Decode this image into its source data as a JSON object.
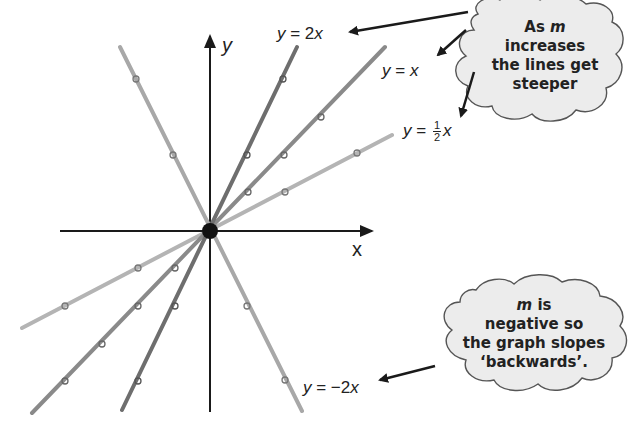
{
  "diagram": {
    "type": "graph-of-lines-through-origin",
    "axes": {
      "x_label": "x",
      "y_label": "y"
    },
    "origin_marker": "filled-dot",
    "lines": [
      {
        "id": "y2x",
        "equation": "y = 2x",
        "slope": 2,
        "color": "#6e6e6e"
      },
      {
        "id": "yx",
        "equation": "y = x",
        "slope": 1,
        "color": "#8a8a8a"
      },
      {
        "id": "yhalfx",
        "equation": "y = ½x",
        "slope": 0.5,
        "color": "#b4b4b4"
      },
      {
        "id": "yneg2x",
        "equation": "y = −2x",
        "slope": -2,
        "color": "#a8a8a8"
      }
    ],
    "labels": {
      "y2x": {
        "lhs": "y",
        "eq": " = 2",
        "var": "x"
      },
      "yx": {
        "lhs": "y",
        "eq": " = ",
        "var": "x"
      },
      "yhalfx": {
        "lhs": "y",
        "eq": " = ",
        "num": "1",
        "den": "2",
        "var": "x"
      },
      "yneg2x": {
        "lhs": "y",
        "eq": " = −2",
        "var": "x"
      }
    },
    "clouds": {
      "top": {
        "line1_prefix": "As ",
        "line1_var": "m",
        "line2": "increases",
        "line3": "the lines get",
        "line4": "steeper"
      },
      "bottom": {
        "line1_var": "m",
        "line1_suffix": " is",
        "line2": "negative so",
        "line3": "the graph slopes",
        "line4": "‘backwards’."
      }
    },
    "colors": {
      "axis": "#1a1a1a",
      "text": "#222222",
      "cloud_fill": "#ececec",
      "cloud_stroke": "#555555"
    }
  }
}
